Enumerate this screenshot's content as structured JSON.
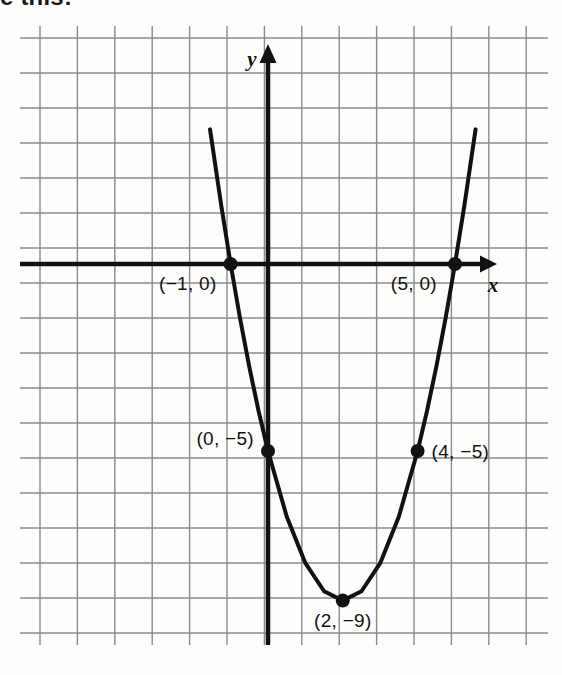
{
  "page": {
    "background_color": "#fdfdfc",
    "cut_off_heading": "e this:"
  },
  "figure": {
    "name": "parabola-graph",
    "grid": {
      "line_color": "#8a8a8a",
      "spacing_px": 37.4,
      "x_min_px": 40,
      "x_max_px": 528,
      "y_min_px": 38,
      "y_max_px": 633,
      "columns": 14,
      "rows": 17
    },
    "axes": {
      "color": "#111111",
      "x_axis_label": "x",
      "y_axis_label": "y",
      "x_axis_y_px": 264,
      "y_axis_x_px": 268,
      "x_arrow_tip_px": 497,
      "y_arrow_tip_px": 44
    },
    "curve": {
      "color": "#111111",
      "stroke_width": 4
    }
  },
  "chart_data": {
    "type": "line",
    "title": "",
    "xlabel": "x",
    "ylabel": "y",
    "grid": true,
    "legend": "none",
    "equation": "y = x^2 - 4x - 5",
    "xlim": [
      -6.1,
      6.95
    ],
    "ylim": [
      -9.85,
      6.05
    ],
    "vertex": {
      "x": 2,
      "y": -9
    },
    "roots": [
      -1,
      5
    ],
    "x": [
      -1.55,
      -1.25,
      -1,
      -0.75,
      -0.5,
      -0.25,
      0,
      0.5,
      1,
      1.5,
      2,
      2.5,
      3,
      3.5,
      4,
      4.25,
      4.5,
      4.75,
      5,
      5.25,
      5.55
    ],
    "y": [
      3.6,
      1.5625,
      0,
      -1.4375,
      -2.75,
      -3.9375,
      -5,
      -6.75,
      -8,
      -8.75,
      -9,
      -8.75,
      -8,
      -6.75,
      -5,
      -3.9375,
      -2.75,
      -1.4375,
      0,
      1.5625,
      3.6
    ],
    "points": [
      {
        "name": "root-left",
        "x": -1,
        "y": 0,
        "label": "(−1, 0)",
        "label_anchor": "end",
        "label_dx": -14,
        "label_dy": 26
      },
      {
        "name": "root-right",
        "x": 5,
        "y": 0,
        "label": "(5, 0)",
        "label_anchor": "end",
        "label_dx": -18,
        "label_dy": 26
      },
      {
        "name": "y-intercept",
        "x": 0,
        "y": -5,
        "label": "(0, −5)",
        "label_anchor": "end",
        "label_dx": -14,
        "label_dy": -6
      },
      {
        "name": "mirror-point",
        "x": 4,
        "y": -5,
        "label": "(4, −5)",
        "label_anchor": "start",
        "label_dx": 14,
        "label_dy": 7
      },
      {
        "name": "vertex",
        "x": 2,
        "y": -9,
        "label": "(2, −9)",
        "label_anchor": "middle",
        "label_dx": 0,
        "label_dy": 26
      }
    ]
  }
}
